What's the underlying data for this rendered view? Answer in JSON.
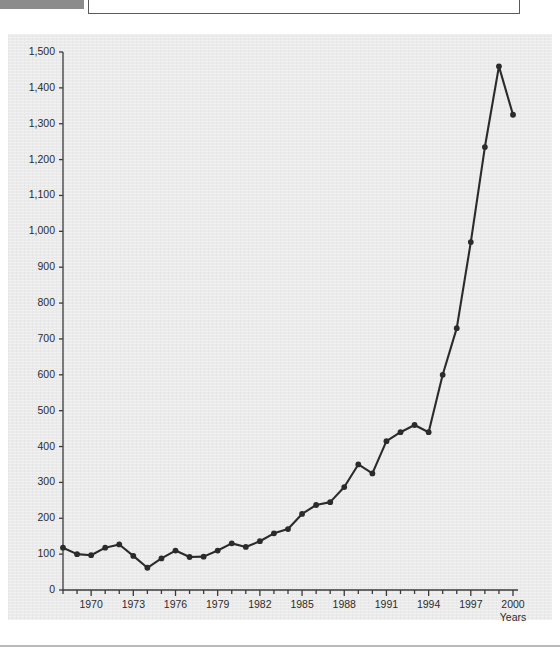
{
  "document": {
    "tab_label": "",
    "header_note": ""
  },
  "chart_data": {
    "type": "line",
    "title": "",
    "subtitle": "",
    "xlabel": "Years",
    "ylabel": "",
    "xlim": [
      1968,
      2000
    ],
    "ylim": [
      0,
      1500
    ],
    "grid": false,
    "legend": null,
    "y_ticks": [
      0,
      100,
      200,
      300,
      400,
      500,
      600,
      700,
      800,
      900,
      1000,
      1100,
      1200,
      1300,
      1400,
      1500
    ],
    "y_tick_labels": [
      "0",
      "100",
      "200",
      "300",
      "400",
      "500",
      "600",
      "700",
      "800",
      "900",
      "1,000",
      "1,100",
      "1,200",
      "1,300",
      "1,400",
      "1,500"
    ],
    "x_ticks": [
      1970,
      1973,
      1976,
      1979,
      1982,
      1985,
      1988,
      1991,
      1994,
      1997,
      2000
    ],
    "x_tick_labels": [
      "1970",
      "1973",
      "1976",
      "1979",
      "1982",
      "1985",
      "1988",
      "1991",
      "1994",
      "1997",
      "2000"
    ],
    "x_minor_step": 1,
    "series": [
      {
        "name": "series-1",
        "color": "#2b2b2b",
        "marker": "circle",
        "x": [
          1968,
          1969,
          1970,
          1971,
          1972,
          1973,
          1974,
          1975,
          1976,
          1977,
          1978,
          1979,
          1980,
          1981,
          1982,
          1983,
          1984,
          1985,
          1986,
          1987,
          1988,
          1989,
          1990,
          1991,
          1992,
          1993,
          1994,
          1995,
          1996,
          1997,
          1998,
          1999,
          2000
        ],
        "values": [
          118,
          100,
          97,
          118,
          127,
          95,
          62,
          88,
          110,
          92,
          93,
          110,
          130,
          120,
          136,
          158,
          170,
          212,
          237,
          245,
          287,
          350,
          325,
          415,
          440,
          460,
          440,
          600,
          730,
          970,
          1235,
          1460,
          1325
        ]
      }
    ]
  },
  "colors": {
    "panel_background": "#ebebeb",
    "axis": "#3a3a3a",
    "line": "#2b2b2b",
    "page_background": "#ffffff"
  }
}
